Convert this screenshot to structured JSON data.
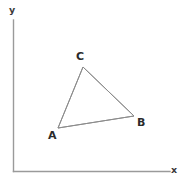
{
  "figure": {
    "type": "geometry-diagram",
    "background_color": "#ffffff",
    "axes": {
      "line_color": "#9a9a9a",
      "line_width": 1.4,
      "origin": {
        "x": 13.5,
        "y": 171.5
      },
      "y_axis": {
        "top": 20,
        "bottom": 171.5,
        "x": 13.5
      },
      "x_axis": {
        "left": 13.5,
        "right": 170,
        "y": 171.5
      },
      "x_label": "x",
      "y_label": "y",
      "ticks": "none",
      "grid": "off"
    },
    "triangle": {
      "stroke_color": "#8c8c8c",
      "stroke_width": 1,
      "fill": "none",
      "vertices": [
        {
          "name": "A",
          "x": 58,
          "y": 128,
          "label": "A",
          "label_position": "below-left"
        },
        {
          "name": "B",
          "x": 134,
          "y": 116,
          "label": "B",
          "label_position": "right"
        },
        {
          "name": "C",
          "x": 83,
          "y": 67,
          "label": "C",
          "label_position": "above"
        }
      ],
      "edges": [
        {
          "from": "A",
          "to": "C"
        },
        {
          "from": "C",
          "to": "B"
        },
        {
          "from": "B",
          "to": "A"
        }
      ]
    },
    "label_color": "#2b2b2b"
  }
}
